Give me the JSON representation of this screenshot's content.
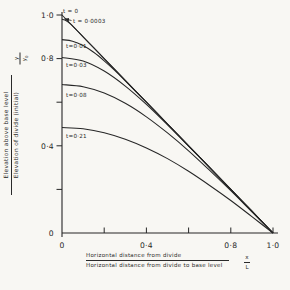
{
  "colors": {
    "ink": "#262626",
    "background": "#f8f7f3"
  },
  "axes": {
    "y": {
      "symbol_top": "y",
      "symbol_bottom_base": "y",
      "symbol_bottom_sub": "0",
      "caption_numerator": "Elevation above base level",
      "caption_denominator": "Elevation of divide (initial)",
      "ticks": [
        {
          "v": 1.0,
          "label": "1·0"
        },
        {
          "v": 0.8,
          "label": "0·8"
        },
        {
          "v": 0.6,
          "label": ""
        },
        {
          "v": 0.4,
          "label": "0·4"
        },
        {
          "v": 0.2,
          "label": ""
        },
        {
          "v": 0.0,
          "label": "0"
        }
      ]
    },
    "x": {
      "symbol_top": "x",
      "symbol_bottom": "L",
      "caption_numerator": "Horizontal distance from divide",
      "caption_denominator": "Horizontal distance from divide to base level",
      "ticks": [
        {
          "v": 0.0,
          "label": "0"
        },
        {
          "v": 0.2,
          "label": ""
        },
        {
          "v": 0.4,
          "label": "0·4"
        },
        {
          "v": 0.6,
          "label": ""
        },
        {
          "v": 0.8,
          "label": "0·8"
        },
        {
          "v": 1.0,
          "label": "1·0"
        }
      ]
    }
  },
  "chart_data": {
    "type": "line",
    "title": "",
    "xlabel": "Horizontal distance from divide / Horizontal distance from divide to base level (x/L)",
    "ylabel": "Elevation above base level / Elevation of divide (initial) (y/y0)",
    "xlim": [
      0,
      1
    ],
    "ylim": [
      0,
      1
    ],
    "grid": false,
    "legend_position": "on-curve-labels",
    "series": [
      {
        "name": "t=0",
        "label": "t = 0",
        "label_px": [
          63,
          13
        ],
        "points": [
          [
            0,
            1
          ],
          [
            1,
            0
          ]
        ]
      },
      {
        "name": "t=0.0003",
        "label": "t = 0·0003",
        "label_px": [
          73,
          22.5
        ],
        "arrow": {
          "from": [
            71.5,
            20.5
          ],
          "to": [
            64.5,
            18.8
          ]
        },
        "points": [
          [
            0,
            0.98
          ],
          [
            0.02,
            0.974
          ],
          [
            0.04,
            0.959
          ],
          [
            0.06,
            0.94
          ],
          [
            0.08,
            0.92
          ],
          [
            0.1,
            0.9
          ],
          [
            0.15,
            0.85
          ],
          [
            0.2,
            0.8
          ],
          [
            0.3,
            0.7
          ],
          [
            0.4,
            0.6
          ],
          [
            0.5,
            0.5
          ],
          [
            0.6,
            0.4
          ],
          [
            0.7,
            0.3
          ],
          [
            0.8,
            0.2
          ],
          [
            0.9,
            0.1
          ],
          [
            1,
            0
          ]
        ]
      },
      {
        "name": "t=0.01",
        "label": "t=0·01",
        "label_px": [
          66,
          47.5
        ],
        "points": [
          [
            0,
            0.887
          ],
          [
            0.05,
            0.88
          ],
          [
            0.1,
            0.86
          ],
          [
            0.15,
            0.829
          ],
          [
            0.2,
            0.79
          ],
          [
            0.25,
            0.746
          ],
          [
            0.3,
            0.698
          ],
          [
            0.35,
            0.649
          ],
          [
            0.4,
            0.6
          ],
          [
            0.5,
            0.5
          ],
          [
            0.6,
            0.4
          ],
          [
            0.7,
            0.3
          ],
          [
            0.8,
            0.2
          ],
          [
            0.9,
            0.1
          ],
          [
            1,
            0
          ]
        ]
      },
      {
        "name": "t=0.03",
        "label": "t=0·03",
        "label_px": [
          66,
          67
        ],
        "points": [
          [
            0,
            0.805
          ],
          [
            0.1,
            0.789
          ],
          [
            0.2,
            0.743
          ],
          [
            0.3,
            0.674
          ],
          [
            0.4,
            0.59
          ],
          [
            0.5,
            0.496
          ],
          [
            0.6,
            0.399
          ],
          [
            0.7,
            0.3
          ],
          [
            0.8,
            0.2
          ],
          [
            0.9,
            0.1
          ],
          [
            1,
            0
          ]
        ]
      },
      {
        "name": "t=0.08",
        "label": "t=0·08",
        "label_px": [
          66,
          96.5
        ],
        "points": [
          [
            0,
            0.681
          ],
          [
            0.1,
            0.671
          ],
          [
            0.2,
            0.642
          ],
          [
            0.3,
            0.595
          ],
          [
            0.4,
            0.533
          ],
          [
            0.5,
            0.459
          ],
          [
            0.6,
            0.377
          ],
          [
            0.7,
            0.287
          ],
          [
            0.8,
            0.194
          ],
          [
            0.9,
            0.097
          ],
          [
            1,
            0
          ]
        ]
      },
      {
        "name": "t=0.21",
        "label": "t=0·21",
        "label_px": [
          66,
          137.5
        ],
        "points": [
          [
            0,
            0.484
          ],
          [
            0.1,
            0.478
          ],
          [
            0.2,
            0.46
          ],
          [
            0.3,
            0.43
          ],
          [
            0.4,
            0.39
          ],
          [
            0.5,
            0.341
          ],
          [
            0.6,
            0.283
          ],
          [
            0.7,
            0.218
          ],
          [
            0.8,
            0.149
          ],
          [
            0.9,
            0.075
          ],
          [
            1,
            0
          ]
        ]
      }
    ]
  }
}
